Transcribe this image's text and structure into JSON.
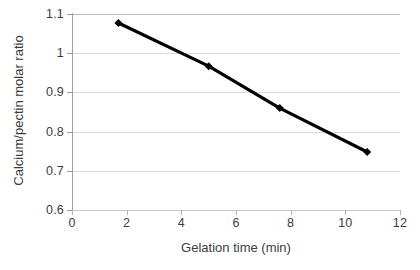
{
  "chart_data": {
    "type": "line",
    "title": "",
    "xlabel": "Gelation time (min)",
    "ylabel": "Calcium/pectin molar ratio",
    "xlim": [
      0,
      12
    ],
    "ylim": [
      0.6,
      1.1
    ],
    "xticks": [
      "0",
      "2",
      "4",
      "6",
      "8",
      "10",
      "12"
    ],
    "xtick_values": [
      0,
      2,
      4,
      6,
      8,
      10,
      12
    ],
    "yticks": [
      "0.6",
      "0.7",
      "0.8",
      "0.9",
      "1",
      "1.1"
    ],
    "ytick_values": [
      0.6,
      0.7,
      0.8,
      0.9,
      1.0,
      1.1
    ],
    "grid": "horizontal",
    "legend": "none",
    "series": [
      {
        "name": "Calcium/pectin molar ratio",
        "color": "#000000",
        "marker": "diamond",
        "x": [
          1.7,
          5.0,
          7.6,
          10.8
        ],
        "y": [
          1.077,
          0.967,
          0.86,
          0.748
        ]
      }
    ]
  },
  "axis": {
    "x_title": "Gelation time (min)",
    "y_title": "Calcium/pectin molar ratio"
  }
}
